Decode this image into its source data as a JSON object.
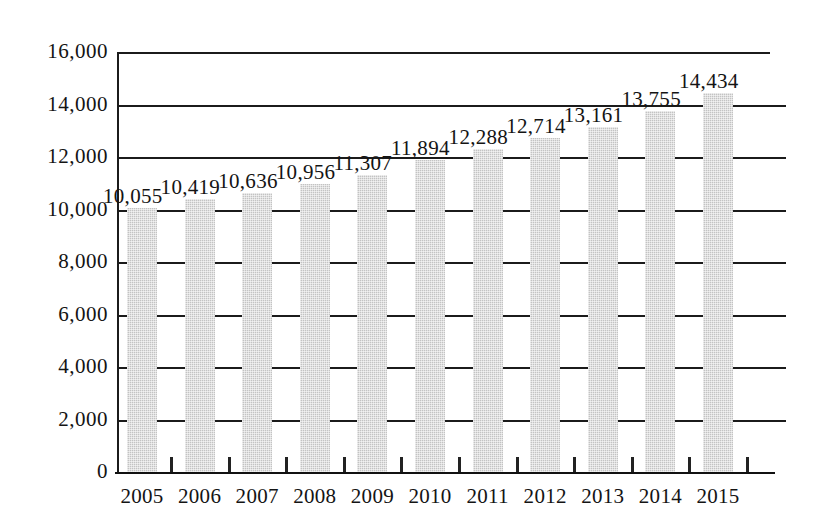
{
  "chart_data": {
    "type": "bar",
    "title": "",
    "subtitle": "",
    "xlabel": "",
    "ylabel": "",
    "categories": [
      "2005",
      "2006",
      "2007",
      "2008",
      "2009",
      "2010",
      "2011",
      "2012",
      "2013",
      "2014",
      "2015"
    ],
    "values": [
      10055,
      10419,
      10636,
      10956,
      11307,
      11894,
      12288,
      12714,
      13161,
      13755,
      14434
    ],
    "value_labels": [
      "10,055",
      "10,419",
      "10,636",
      "10,956",
      "11,307",
      "11,894",
      "12,288",
      "12,714",
      "13,161",
      "13,755",
      "14,434"
    ],
    "ylim": [
      0,
      16000
    ],
    "ytick_values": [
      0,
      2000,
      4000,
      6000,
      8000,
      10000,
      12000,
      14000,
      16000
    ],
    "ytick_labels": [
      "0",
      "2,000",
      "4,000",
      "6,000",
      "8,000",
      "10,000",
      "12,000",
      "14,000",
      "16,000"
    ],
    "grid": true,
    "grid_axis": "y",
    "legend": false,
    "legend_position": "none",
    "bar_color": "#c3c3c3",
    "axis_color": "#1b1b1b",
    "text_color": "#141414",
    "background_color": "#ffffff"
  },
  "axis": {
    "y_labels": [
      "16,000",
      "14,000",
      "12,000",
      "10,000",
      "8,000",
      "6,000",
      "4,000",
      "2,000",
      "0"
    ],
    "x_labels": [
      "2005",
      "2006",
      "2007",
      "2008",
      "2009",
      "2010",
      "2011",
      "2012",
      "2013",
      "2014",
      "2015"
    ]
  }
}
